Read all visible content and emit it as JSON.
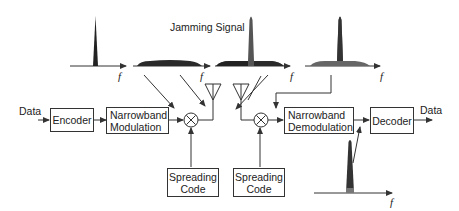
{
  "title": "Jamming Signal",
  "blocks": {
    "encoder": "Encoder",
    "modulation": [
      "Narrowband",
      "Modulation"
    ],
    "spreading_tx": [
      "Spreading",
      "Code"
    ],
    "spreading_rx": [
      "Spreading",
      "Code"
    ],
    "demodulation": [
      "Narrowband",
      "Demodulation"
    ],
    "decoder": "Decoder"
  },
  "labels": {
    "data_in": "Data",
    "data_out": "Data",
    "freq_axis": "f"
  },
  "multiplier_symbol": "⊗",
  "spectra": [
    {
      "name": "narrowband-signal",
      "shape": "narrow-peak",
      "color": "#222222"
    },
    {
      "name": "spread-signal",
      "shape": "wide-flat",
      "color": "#2a2a2a"
    },
    {
      "name": "spread-signal-plus-jammer",
      "shape": "wide-flat-with-peak",
      "color": "#555555"
    },
    {
      "name": "received-spread-signal",
      "shape": "wide-flat-with-peak",
      "color": "#666666"
    },
    {
      "name": "despread-signal",
      "shape": "narrow-peak",
      "color": "#333333"
    }
  ],
  "colors": {
    "line": "#333333",
    "dark_fill": "#222222",
    "mid_fill": "#666666"
  }
}
